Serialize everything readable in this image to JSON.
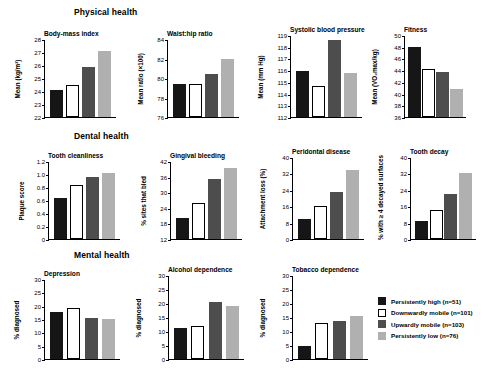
{
  "sections": [
    {
      "id": "physical",
      "label": "Physical health"
    },
    {
      "id": "dental",
      "label": "Dental health"
    },
    {
      "id": "mental",
      "label": "Mental health"
    }
  ],
  "legend": {
    "entries": [
      {
        "key": "g0",
        "label": "Persistently high (n=51)"
      },
      {
        "key": "g1",
        "label": "Downwardly mobile (n=101)"
      },
      {
        "key": "g2",
        "label": "Upwardly mobile (n=103)"
      },
      {
        "key": "g3",
        "label": "Persistently low (n=76)"
      }
    ]
  },
  "colors": {
    "g0": "#161616",
    "g1": "#ffffff",
    "g2": "#4d4d4d",
    "g3": "#b0b0b0",
    "axis": "#000000",
    "background": "#ffffff"
  },
  "chart_data": [
    {
      "id": "bmi",
      "type": "bar",
      "title": "Body-mass index",
      "section": "Physical health",
      "ylabel": "Mean (kg/m²)",
      "xlabel": "",
      "categories": [
        "Persistently high (n=51)",
        "Downwardly mobile (n=101)",
        "Upwardly mobile (n=103)",
        "Persistently low (n=76)"
      ],
      "values": [
        24.05,
        24.45,
        25.85,
        27.1
      ],
      "ylim": [
        22,
        28
      ],
      "yticks": [
        22,
        23,
        24,
        25,
        26,
        27,
        28
      ],
      "ytick_labels": [
        "22",
        "23",
        "24",
        "25",
        "26",
        "27",
        "28"
      ],
      "grid": false
    },
    {
      "id": "waist_hip",
      "type": "bar",
      "title": "Waist:hip ratio",
      "section": "Physical health",
      "ylabel": "Mean ratio (×100)",
      "xlabel": "",
      "categories": [
        "Persistently high (n=51)",
        "Downwardly mobile (n=101)",
        "Upwardly mobile (n=103)",
        "Persistently low (n=76)"
      ],
      "values": [
        79.4,
        79.4,
        80.4,
        82.0
      ],
      "ylim": [
        76,
        84
      ],
      "yticks": [
        76,
        78,
        80,
        82,
        84
      ],
      "ytick_labels": [
        "76",
        "78",
        "80",
        "82",
        "84"
      ],
      "grid": false
    },
    {
      "id": "systolic_bp",
      "type": "bar",
      "title": "Systolic blood pressure",
      "section": "Physical health",
      "ylabel": "Mean (mm Hg)",
      "xlabel": "",
      "categories": [
        "Persistently high (n=51)",
        "Downwardly mobile (n=101)",
        "Upwardly mobile (n=103)",
        "Persistently low (n=76)"
      ],
      "values": [
        115.9,
        114.65,
        118.6,
        115.75
      ],
      "ylim": [
        112,
        119
      ],
      "yticks": [
        112,
        113,
        114,
        115,
        116,
        117,
        118,
        119
      ],
      "ytick_labels": [
        "112",
        "113",
        "114",
        "115",
        "116",
        "117",
        "118",
        "119"
      ],
      "grid": false
    },
    {
      "id": "fitness",
      "type": "bar",
      "title": "Fitness",
      "section": "Physical health",
      "ylabel": "Mean (VO₂max/kg)",
      "xlabel": "",
      "categories": [
        "Persistently high (n=51)",
        "Downwardly mobile (n=101)",
        "Upwardly mobile (n=103)",
        "Persistently low (n=76)"
      ],
      "values": [
        48.0,
        44.2,
        43.7,
        40.7
      ],
      "ylim": [
        36,
        50
      ],
      "yticks": [
        36,
        38,
        40,
        42,
        44,
        46,
        48,
        50
      ],
      "ytick_labels": [
        "36",
        "38",
        "40",
        "42",
        "44",
        "46",
        "48",
        "50"
      ],
      "grid": false
    },
    {
      "id": "tooth_cleanliness",
      "type": "bar",
      "title": "Tooth cleanliness",
      "section": "Dental health",
      "ylabel": "Plaque score",
      "xlabel": "",
      "categories": [
        "Persistently high (n=51)",
        "Downwardly mobile (n=101)",
        "Upwardly mobile (n=103)",
        "Persistently low (n=76)"
      ],
      "values": [
        0.63,
        0.83,
        0.95,
        1.01
      ],
      "ylim": [
        0,
        1.2
      ],
      "yticks": [
        0,
        0.2,
        0.4,
        0.6,
        0.8,
        1.0,
        1.2
      ],
      "ytick_labels": [
        "0",
        "0.2",
        "0.4",
        "0.6",
        "0.8",
        "1.0",
        "1.2"
      ],
      "grid": false
    },
    {
      "id": "gingival_bleeding",
      "type": "bar",
      "title": "Gingival bleeding",
      "section": "Dental health",
      "ylabel": "% sites that bled",
      "xlabel": "",
      "categories": [
        "Persistently high (n=51)",
        "Downwardly mobile (n=101)",
        "Upwardly mobile (n=103)",
        "Persistently low (n=76)"
      ],
      "values": [
        20.0,
        26.0,
        35.0,
        39.5
      ],
      "ylim": [
        12,
        42
      ],
      "yticks": [
        12,
        18,
        24,
        30,
        36,
        42
      ],
      "ytick_labels": [
        "12",
        "18",
        "24",
        "30",
        "36",
        "42"
      ],
      "grid": false
    },
    {
      "id": "periodontal_disease",
      "type": "bar",
      "title": "Peridontal disease",
      "section": "Dental health",
      "ylabel": "Attachment loss (%)",
      "xlabel": "",
      "categories": [
        "Persistently high (n=51)",
        "Downwardly mobile (n=101)",
        "Upwardly mobile (n=103)",
        "Persistently low (n=76)"
      ],
      "values": [
        10.0,
        16.0,
        23.0,
        33.5
      ],
      "ylim": [
        0,
        40
      ],
      "yticks": [
        0,
        8,
        16,
        24,
        32,
        40
      ],
      "ytick_labels": [
        "0",
        "8",
        "16",
        "24",
        "32",
        "40"
      ],
      "grid": false
    },
    {
      "id": "tooth_decay",
      "type": "bar",
      "title": "Tooth decay",
      "section": "Dental health",
      "ylabel": "% with ≥ 4 decayed surfaces",
      "xlabel": "",
      "categories": [
        "Persistently high (n=51)",
        "Downwardly mobile (n=101)",
        "Upwardly mobile (n=103)",
        "Persistently low (n=76)"
      ],
      "values": [
        9.0,
        14.0,
        22.0,
        32.0
      ],
      "ylim": [
        0,
        40
      ],
      "yticks": [
        0,
        8,
        16,
        24,
        32,
        40
      ],
      "ytick_labels": [
        "0",
        "8",
        "16",
        "24",
        "32",
        "40"
      ],
      "grid": false
    },
    {
      "id": "depression",
      "type": "bar",
      "title": "Depression",
      "section": "Mental health",
      "ylabel": "% diagnosed",
      "xlabel": "",
      "categories": [
        "Persistently high (n=51)",
        "Downwardly mobile (n=101)",
        "Upwardly mobile (n=103)",
        "Persistently low (n=76)"
      ],
      "values": [
        17.5,
        19.0,
        15.2,
        15.0
      ],
      "ylim": [
        0,
        30
      ],
      "yticks": [
        0,
        5,
        10,
        15,
        20,
        25,
        30
      ],
      "ytick_labels": [
        "0",
        "5",
        "10",
        "15",
        "20",
        "25",
        "30"
      ],
      "grid": false
    },
    {
      "id": "alcohol_dependence",
      "type": "bar",
      "title": "Alcohol dependence",
      "section": "Mental health",
      "ylabel": "% diagnosed",
      "xlabel": "",
      "categories": [
        "Persistently high (n=51)",
        "Downwardly mobile (n=101)",
        "Upwardly mobile (n=103)",
        "Persistently low (n=76)"
      ],
      "values": [
        11.0,
        11.8,
        20.2,
        19.0
      ],
      "ylim": [
        0,
        30
      ],
      "yticks": [
        0,
        5,
        10,
        15,
        20,
        25,
        30
      ],
      "ytick_labels": [
        "0",
        "5",
        "10",
        "15",
        "20",
        "25",
        "30"
      ],
      "grid": false
    },
    {
      "id": "tobacco_dependence",
      "type": "bar",
      "title": "Tobacco dependence",
      "section": "Mental health",
      "ylabel": "% diagnosed",
      "xlabel": "",
      "categories": [
        "Persistently high (n=51)",
        "Downwardly mobile (n=101)",
        "Upwardly mobile (n=103)",
        "Persistently low (n=76)"
      ],
      "values": [
        4.5,
        12.8,
        13.6,
        15.3
      ],
      "ylim": [
        0,
        30
      ],
      "yticks": [
        0,
        5,
        10,
        15,
        20,
        25,
        30
      ],
      "ytick_labels": [
        "0",
        "5",
        "10",
        "15",
        "20",
        "25",
        "30"
      ],
      "grid": false
    }
  ]
}
